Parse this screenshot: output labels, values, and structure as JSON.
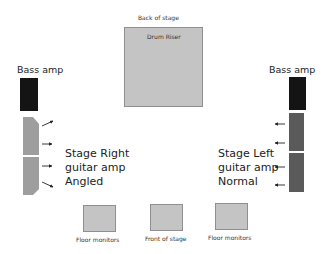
{
  "diagram": {
    "back_label": "Back of stage",
    "front_label": "Front of stage",
    "drum_riser": {
      "label": "Drum Riser",
      "color": "#c4c4c4"
    },
    "left": {
      "bass_label": "Bass amp",
      "bass_color": "#141414",
      "guitar_label": "Stage Right\nguitar amp\nAngled",
      "guitar_color": "#9e9e9e"
    },
    "right": {
      "bass_label": "Bass amp",
      "bass_color": "#141414",
      "guitar_label": "Stage Left\nguitar amp\nNormal",
      "guitar_color": "#5a5a5a"
    },
    "monitors": [
      {
        "label": "Floor monitors"
      },
      {
        "label": "Front of stage"
      },
      {
        "label": "Floor monitors"
      }
    ]
  }
}
